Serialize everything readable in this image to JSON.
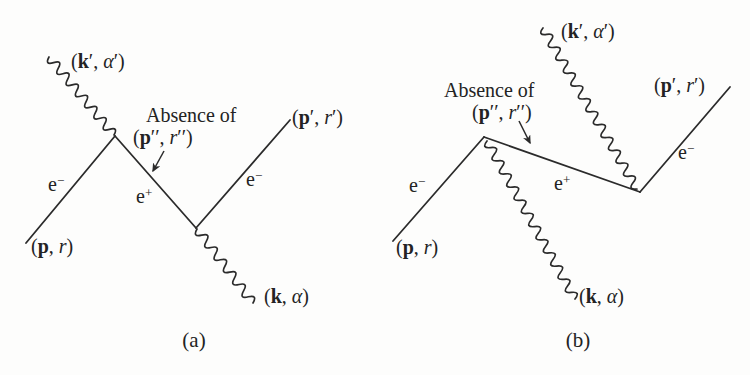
{
  "figure": {
    "background_color": "#fdfdfc",
    "ink_color": "#2b2b2b"
  },
  "diagram_a": {
    "caption": "(a)",
    "absence_note": {
      "line1": "Absence of",
      "line2": [
        {
          "t": "("
        },
        {
          "t": "p",
          "s": "b"
        },
        {
          "t": "′′, "
        },
        {
          "t": "r",
          "s": "i"
        },
        {
          "t": "′′)"
        }
      ]
    },
    "labels": {
      "photon_in": [
        {
          "t": "("
        },
        {
          "t": "k",
          "s": "b"
        },
        {
          "t": "′, "
        },
        {
          "t": "α",
          "s": "i"
        },
        {
          "t": "′)"
        }
      ],
      "electron_in": [
        {
          "t": "e"
        },
        {
          "t": "−",
          "s": "sup"
        }
      ],
      "electron_in_momentum": [
        {
          "t": "("
        },
        {
          "t": "p",
          "s": "b"
        },
        {
          "t": ", "
        },
        {
          "t": "r",
          "s": "i"
        },
        {
          "t": ")"
        }
      ],
      "positron_internal": [
        {
          "t": "e"
        },
        {
          "t": "+",
          "s": "sup"
        }
      ],
      "electron_out": [
        {
          "t": "e"
        },
        {
          "t": "−",
          "s": "sup"
        }
      ],
      "electron_out_momentum": [
        {
          "t": "("
        },
        {
          "t": "p",
          "s": "b"
        },
        {
          "t": "′, "
        },
        {
          "t": "r",
          "s": "i"
        },
        {
          "t": "′)"
        }
      ],
      "photon_out": [
        {
          "t": "("
        },
        {
          "t": "k",
          "s": "b"
        },
        {
          "t": ", "
        },
        {
          "t": "α",
          "s": "i"
        },
        {
          "t": ")"
        }
      ]
    }
  },
  "diagram_b": {
    "caption": "(b)",
    "absence_note": {
      "line1": "Absence of",
      "line2": [
        {
          "t": "("
        },
        {
          "t": "p",
          "s": "b"
        },
        {
          "t": "′′, "
        },
        {
          "t": "r",
          "s": "i"
        },
        {
          "t": "′′)"
        }
      ]
    },
    "labels": {
      "photon_in": [
        {
          "t": "("
        },
        {
          "t": "k",
          "s": "b"
        },
        {
          "t": "′, "
        },
        {
          "t": "α",
          "s": "i"
        },
        {
          "t": "′)"
        }
      ],
      "electron_in": [
        {
          "t": "e"
        },
        {
          "t": "−",
          "s": "sup"
        }
      ],
      "electron_in_momentum": [
        {
          "t": "("
        },
        {
          "t": "p",
          "s": "b"
        },
        {
          "t": ", "
        },
        {
          "t": "r",
          "s": "i"
        },
        {
          "t": ")"
        }
      ],
      "positron_internal": [
        {
          "t": "e"
        },
        {
          "t": "+",
          "s": "sup"
        }
      ],
      "electron_out": [
        {
          "t": "e"
        },
        {
          "t": "−",
          "s": "sup"
        }
      ],
      "electron_out_momentum": [
        {
          "t": "("
        },
        {
          "t": "p",
          "s": "b"
        },
        {
          "t": "′, "
        },
        {
          "t": "r",
          "s": "i"
        },
        {
          "t": "′)"
        }
      ],
      "photon_out": [
        {
          "t": "("
        },
        {
          "t": "k",
          "s": "b"
        },
        {
          "t": ", "
        },
        {
          "t": "α",
          "s": "i"
        },
        {
          "t": ")"
        }
      ]
    }
  }
}
